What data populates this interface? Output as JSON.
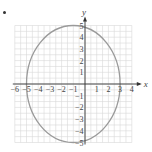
{
  "chart_data": {
    "type": "line",
    "title": "",
    "xlabel": "x",
    "ylabel": "y",
    "xlim": [
      -6.5,
      4.2
    ],
    "ylim": [
      -5.2,
      5.3
    ],
    "grid": true,
    "x_ticks": [
      -6,
      -5,
      -4,
      -3,
      -2,
      -1,
      1,
      2,
      3,
      4
    ],
    "y_ticks": [
      -5,
      -4,
      -3,
      -2,
      -1,
      1,
      2,
      3,
      4,
      5
    ],
    "x_tick_labels": [
      "−6",
      "−5",
      "−4",
      "−3",
      "−2",
      "−1",
      "1",
      "2",
      "3",
      "4"
    ],
    "y_tick_labels": [
      "−5",
      "−4",
      "−3",
      "−2",
      "−1",
      "1",
      "2",
      "3",
      "4",
      "5"
    ],
    "series": [
      {
        "name": "ellipse",
        "shape": "ellipse",
        "center": [
          -1,
          0
        ],
        "semi_axis_x": 4,
        "semi_axis_y": 5,
        "equation": "(x+1)^2/16 + y^2/25 = 1",
        "color": "#9a9a9a"
      }
    ],
    "legend": null
  },
  "style": {
    "grid_color": "#d9d9d9",
    "axis_color": "#333333",
    "curve_color": "#9a9a9a",
    "text_color": "#444444"
  },
  "layout": {
    "origin_px": [
      85,
      84
    ],
    "unit_px": 11.7,
    "grid_x_range": [
      -6,
      4
    ],
    "grid_y_range": [
      -5,
      5
    ]
  }
}
